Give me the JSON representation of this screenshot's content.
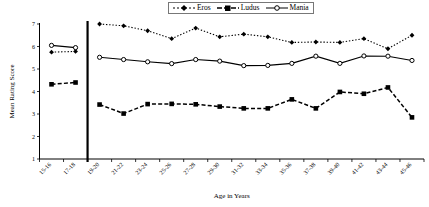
{
  "chart_data": {
    "type": "line",
    "title": "",
    "xlabel": "Age in Years",
    "ylabel": "Mean Rating Score",
    "ylim": [
      1,
      7
    ],
    "yticks": [
      1,
      2,
      3,
      4,
      5,
      6,
      7
    ],
    "grid": false,
    "legend_position": "top-center",
    "categories": [
      "15-16",
      "17-18",
      "19-20",
      "21-22",
      "23-24",
      "25-26",
      "27-28",
      "29-30",
      "31-32",
      "33-34",
      "35-36",
      "37-38",
      "39-40",
      "41-42",
      "43-44",
      "45-46"
    ],
    "group_divider_after": "17-18",
    "series": [
      {
        "name": "Eros",
        "marker": "diamond",
        "linestyle": "dotted",
        "color": "#000000",
        "values": [
          5.75,
          5.78,
          7.0,
          6.92,
          6.7,
          6.35,
          6.82,
          6.43,
          6.55,
          6.43,
          6.18,
          6.2,
          6.18,
          6.35,
          5.9,
          6.5
        ]
      },
      {
        "name": "Ludus",
        "marker": "square",
        "linestyle": "dashed",
        "color": "#000000",
        "values": [
          4.32,
          4.4,
          3.42,
          3.02,
          3.44,
          3.45,
          3.43,
          3.33,
          3.25,
          3.25,
          3.65,
          3.25,
          3.98,
          3.9,
          4.18,
          2.85
        ]
      },
      {
        "name": "Mania",
        "marker": "circle-open",
        "linestyle": "solid",
        "color": "#000000",
        "values": [
          6.05,
          5.95,
          5.52,
          5.42,
          5.32,
          5.24,
          5.42,
          5.35,
          5.15,
          5.16,
          5.25,
          5.57,
          5.25,
          5.58,
          5.57,
          5.38
        ]
      }
    ]
  },
  "legend": {
    "items": [
      {
        "label": "Eros"
      },
      {
        "label": "Ludus"
      },
      {
        "label": "Mania"
      }
    ]
  }
}
